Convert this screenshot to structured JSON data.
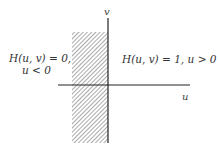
{
  "diagram": {
    "left_region": {
      "line1": "H(u, v) = 0,",
      "line2": "u < 0"
    },
    "right_region": {
      "label": "H(u, v) = 1,  u > 0"
    },
    "axes": {
      "x_label": "u",
      "y_label": "v"
    },
    "colors": {
      "axis": "#222222",
      "hatch": "#555555",
      "text": "#333333"
    }
  }
}
